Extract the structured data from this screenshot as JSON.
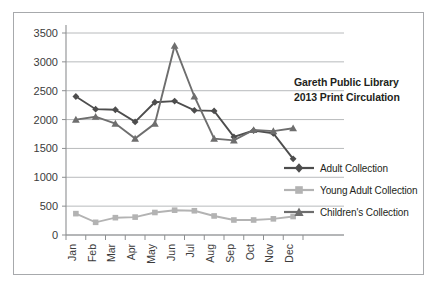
{
  "chart_data": {
    "type": "line",
    "title": "Gareth Public Library 2013 Print Circulation",
    "title_lines": [
      "Gareth Public Library",
      "2013 Print Circulation"
    ],
    "xlabel": "",
    "ylabel": "",
    "categories": [
      "Jan",
      "Feb",
      "Mar",
      "Apr",
      "May",
      "Jun",
      "Jul",
      "Aug",
      "Sep",
      "Oct",
      "Nov",
      "Dec"
    ],
    "ylim": [
      0,
      3500
    ],
    "ytick_labels": [
      "0",
      "500",
      "1000",
      "1500",
      "2000",
      "2500",
      "3000",
      "3500"
    ],
    "ytick_values": [
      0,
      500,
      1000,
      1500,
      2000,
      2500,
      3000,
      3500
    ],
    "grid": true,
    "legend_position": "right",
    "series": [
      {
        "name": "Adult Collection",
        "color": "#4d4d4d",
        "marker": "diamond",
        "values": [
          2400,
          2180,
          2170,
          1960,
          2300,
          2320,
          2160,
          2150,
          1700,
          1810,
          1760,
          1320
        ]
      },
      {
        "name": "Young Adult Collection",
        "color": "#b3b3b3",
        "marker": "square",
        "values": [
          370,
          220,
          300,
          310,
          390,
          430,
          420,
          330,
          260,
          260,
          280,
          320
        ]
      },
      {
        "name": "Children's Collection",
        "color": "#6e6e6e",
        "marker": "triangle",
        "values": [
          2000,
          2050,
          1930,
          1670,
          1930,
          3280,
          2400,
          1670,
          1640,
          1820,
          1800,
          1850
        ]
      }
    ]
  },
  "colors": {
    "frame_border": "#a7a9ac",
    "gridline": "#b0b2b4",
    "axis": "#8d8f91",
    "text": "#231f20",
    "background": "#ffffff"
  },
  "legend": {
    "items": [
      {
        "label": "Adult Collection",
        "marker": "diamond-marker-icon"
      },
      {
        "label": "Young Adult Collection",
        "marker": "square-marker-icon"
      },
      {
        "label": "Children's Collection",
        "marker": "triangle-marker-icon"
      }
    ]
  }
}
